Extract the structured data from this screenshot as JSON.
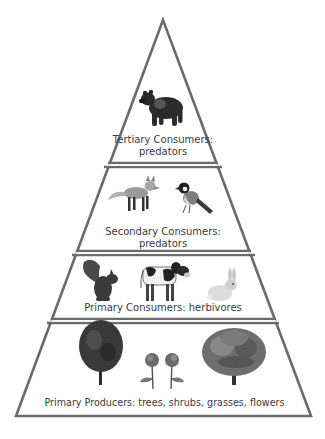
{
  "diagram": {
    "outline_color": "#6b6b6b",
    "text_color": "#3a3a3a",
    "levels": [
      {
        "name": "Tertiary Consumers",
        "label_line1": "Tertiary Consumers:",
        "label_line2": "predators",
        "organisms": [
          "bear-icon"
        ]
      },
      {
        "name": "Secondary Consumers",
        "label_line1": "Secondary Consumers:",
        "label_line2": "predators",
        "organisms": [
          "fox-icon",
          "bird-icon"
        ]
      },
      {
        "name": "Primary Consumers",
        "label_line1": "Primary Consumers: herbivores",
        "organisms": [
          "squirrel-icon",
          "cow-icon",
          "rabbit-icon"
        ]
      },
      {
        "name": "Primary Producers",
        "label_line1": "Primary Producers: trees, shrubs, grasses, flowers",
        "organisms": [
          "tree-icon",
          "flower-icon",
          "flower-icon",
          "oak-tree-icon"
        ]
      }
    ]
  }
}
